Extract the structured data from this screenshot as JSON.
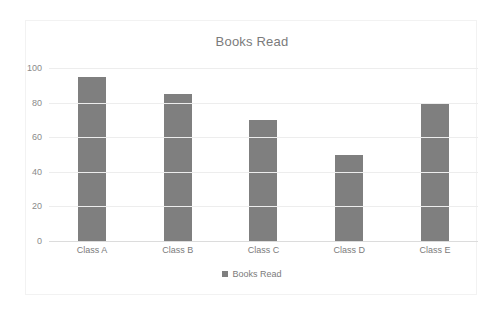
{
  "chart_data": {
    "type": "bar",
    "title": "Books Read",
    "categories": [
      "Class A",
      "Class B",
      "Class C",
      "Class D",
      "Class E"
    ],
    "values": [
      95,
      85,
      70,
      50,
      80
    ],
    "series": [
      {
        "name": "Books Read",
        "values": [
          95,
          85,
          70,
          50,
          80
        ]
      }
    ],
    "xlabel": "",
    "ylabel": "",
    "ylim": [
      0,
      100
    ],
    "yticks": [
      0,
      20,
      40,
      60,
      80,
      100
    ],
    "ytick_labels": [
      "0",
      "20",
      "40",
      "60",
      "80",
      "100"
    ],
    "grid": true,
    "grid_axis": "y",
    "legend": {
      "position": "bottom",
      "entries": [
        {
          "label": "Books Read",
          "color": "#7f7f7f",
          "marker": "square"
        }
      ]
    },
    "colors": {
      "bar": "#7f7f7f",
      "title_text": "#7b7b7b",
      "tick_text": "#8a8a8a",
      "gridline": "#ededed",
      "axis_line": "#dcdcdc",
      "frame_border": "#f2f2f2",
      "background": "#ffffff"
    }
  }
}
